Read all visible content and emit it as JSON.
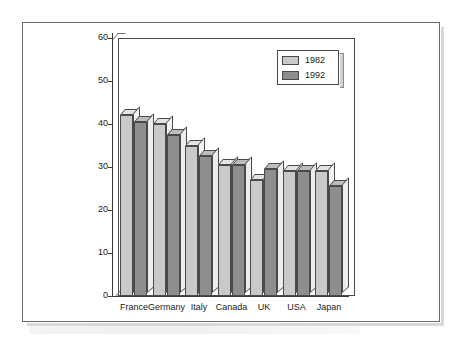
{
  "chart_data": {
    "type": "bar",
    "title": "",
    "xlabel": "",
    "ylabel": "",
    "ylim": [
      0,
      60
    ],
    "ytick_step": 10,
    "yticks": [
      "0",
      "10",
      "20",
      "30",
      "40",
      "50",
      "60"
    ],
    "grid": false,
    "legend_position": "top-right",
    "style": "3d-grouped-bars",
    "categories": [
      "France",
      "Germany",
      "Italy",
      "Canada",
      "UK",
      "USA",
      "Japan"
    ],
    "series": [
      {
        "name": "1982",
        "color": "#c9c9c9",
        "values": [
          42,
          40,
          35,
          30.5,
          27,
          29,
          29
        ]
      },
      {
        "name": "1992",
        "color": "#8e8e8e",
        "values": [
          40.5,
          37.5,
          32.5,
          30.5,
          29.5,
          29,
          25.5
        ]
      }
    ]
  },
  "legend": {
    "entries": [
      {
        "label": "1982",
        "swatch": "#c9c9c9"
      },
      {
        "label": "1992",
        "swatch": "#8e8e8e"
      }
    ]
  }
}
